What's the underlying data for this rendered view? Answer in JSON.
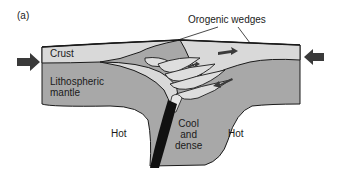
{
  "figure": {
    "panel_label": "(a)",
    "title_annotation": "Orogenic wedges",
    "labels": {
      "crust": "Crust",
      "lithospheric_mantle_line1": "Lithospheric",
      "lithospheric_mantle_line2": "mantle",
      "hot_left": "Hot",
      "hot_right": "Hot",
      "cool_line1": "Cool",
      "cool_line2": "and",
      "cool_line3": "dense"
    },
    "arrows": {
      "left": "convergence-arrow-right",
      "right": "convergence-arrow-left"
    },
    "colors": {
      "crust": "#d9d9d9",
      "mantle": "#a8a8a8",
      "outline": "#1a1a1a",
      "slab": "#111111",
      "arrow": "#3a3a3a",
      "background": "#ffffff"
    }
  }
}
